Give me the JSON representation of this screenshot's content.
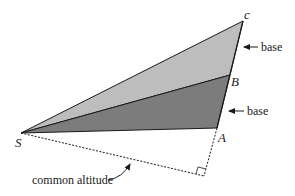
{
  "diagram": {
    "colors": {
      "light_fill": "#bdbdbd",
      "dark_fill": "#7c7c7c",
      "stroke": "#1a1a1a"
    },
    "points": {
      "S": {
        "label": "S",
        "x": 21,
        "y": 133
      },
      "A": {
        "label": "A",
        "x": 217,
        "y": 128
      },
      "B": {
        "label": "B",
        "x": 230,
        "y": 75
      },
      "C": {
        "label": "c",
        "x": 243,
        "y": 21
      },
      "foot": {
        "x": 204,
        "y": 176
      }
    },
    "labels": {
      "S": "S",
      "A": "A",
      "B": "B",
      "C": "c",
      "base_upper": "base",
      "base_lower": "base",
      "altitude": "common altitude"
    }
  }
}
